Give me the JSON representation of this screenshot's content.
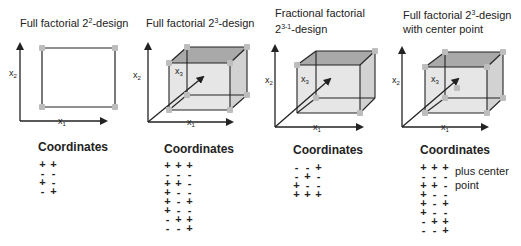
{
  "colors": {
    "line": "#222222",
    "vertex": "#bdbdbd",
    "face_front": "#e6e6e6",
    "face_top": "#a9a9a9",
    "face_side": "#d2d2d2"
  },
  "panels": [
    {
      "id": "full-2-2",
      "title_lines": [
        {
          "pre": "Full factorial  2",
          "sup": "2",
          "post": "-design"
        }
      ],
      "title_pos": [
        20,
        14
      ],
      "axis_labels": {
        "x1": "x",
        "x1_sub": "1",
        "x2": "x",
        "x2_sub": "2"
      },
      "coord_heading": "Coordinates",
      "coord_heading_pos": [
        38,
        140
      ],
      "coords_pos": [
        37,
        160
      ],
      "coordinates": [
        [
          "+",
          "+"
        ],
        [
          "-",
          "-"
        ],
        [
          "+",
          "-"
        ],
        [
          "-",
          "+"
        ]
      ],
      "note": []
    },
    {
      "id": "full-2-3",
      "title_lines": [
        {
          "pre": "Full factorial  2",
          "sup": "3",
          "post": "-design"
        }
      ],
      "title_pos": [
        146,
        14
      ],
      "axis_labels": {
        "x1": "x",
        "x1_sub": "1",
        "x2": "x",
        "x2_sub": "2",
        "x3": "x",
        "x3_sub": "3"
      },
      "coord_heading": "Coordinates",
      "coord_heading_pos": [
        164,
        142
      ],
      "coords_pos": [
        162,
        161
      ],
      "coordinates": [
        [
          "+",
          "+",
          "+"
        ],
        [
          "-",
          "-",
          "-"
        ],
        [
          "+",
          "+",
          "-"
        ],
        [
          "+",
          "-",
          "-"
        ],
        [
          "+",
          "-",
          "+"
        ],
        [
          "+",
          "-",
          "-"
        ],
        [
          "-",
          "+",
          "+"
        ],
        [
          "-",
          "-",
          "+"
        ]
      ],
      "note": []
    },
    {
      "id": "fractional-2-3-1",
      "title_lines": [
        {
          "pre": "Fractional factorial",
          "sup": "",
          "post": ""
        },
        {
          "pre": "2",
          "sup": "3-1",
          "post": "-design"
        }
      ],
      "title_pos": [
        275,
        6
      ],
      "axis_labels": {
        "x1": "x",
        "x1_sub": "1",
        "x2": "x",
        "x2_sub": "2",
        "x3": "x",
        "x3_sub": "3"
      },
      "coord_heading": "Coordinates",
      "coord_heading_pos": [
        293,
        143
      ],
      "coords_pos": [
        291,
        163
      ],
      "coordinates": [
        [
          "-",
          "-",
          "+"
        ],
        [
          "-",
          "+",
          "-"
        ],
        [
          "+",
          "-",
          "-"
        ],
        [
          "+",
          "+",
          "+"
        ]
      ],
      "note": []
    },
    {
      "id": "full-2-3-center",
      "title_lines": [
        {
          "pre": "Full factorial  2",
          "sup": "3",
          "post": "-design"
        },
        {
          "pre": "with center point",
          "sup": "",
          "post": ""
        }
      ],
      "title_pos": [
        403,
        6
      ],
      "axis_labels": {
        "x1": "x",
        "x1_sub": "1",
        "x2": "x",
        "x2_sub": "2",
        "x3": "x",
        "x3_sub": "3"
      },
      "coord_heading": "Coordinates",
      "coord_heading_pos": [
        420,
        143
      ],
      "coords_pos": [
        418,
        163
      ],
      "coordinates": [
        [
          "+",
          "+",
          "+"
        ],
        [
          "-",
          "-",
          "-"
        ],
        [
          "+",
          "+",
          "-"
        ],
        [
          "+",
          "-",
          "-"
        ],
        [
          "+",
          "-",
          "+"
        ],
        [
          "+",
          "-",
          "-"
        ],
        [
          "-",
          "+",
          "+"
        ],
        [
          "-",
          "-",
          "+"
        ]
      ],
      "note": [
        "plus center",
        "point"
      ],
      "note_pos": [
        455,
        164
      ]
    }
  ],
  "geometry": {
    "square": {
      "origin": [
        20,
        121
      ],
      "y_top": 38,
      "x_right": 112,
      "corners": [
        [
          42,
          48
        ],
        [
          115,
          48
        ],
        [
          115,
          107
        ],
        [
          42,
          107
        ]
      ],
      "x1_label": [
        58,
        124
      ],
      "x2_label": [
        9,
        76
      ]
    },
    "cubes": [
      {
        "origin": [
          148,
          122
        ],
        "y_top": 38,
        "x_right": 238,
        "front": [
          [
            169,
            63
          ],
          [
            230,
            63
          ],
          [
            230,
            110
          ],
          [
            169,
            110
          ]
        ],
        "back": [
          [
            187,
            47
          ],
          [
            247,
            47
          ],
          [
            247,
            95
          ],
          [
            187,
            95
          ]
        ],
        "x3_tip": [
          203,
          77
        ],
        "vertices": [
          [
            169,
            63
          ],
          [
            230,
            63
          ],
          [
            230,
            110
          ],
          [
            169,
            110
          ],
          [
            187,
            47
          ],
          [
            247,
            47
          ],
          [
            247,
            95
          ],
          [
            187,
            95
          ]
        ],
        "center": null,
        "x1_label": [
          187,
          125
        ],
        "x2_label": [
          133,
          78
        ],
        "x3_label": [
          175,
          74
        ]
      },
      {
        "origin": [
          275,
          127
        ],
        "y_top": 40,
        "x_right": 368,
        "front": [
          [
            297,
            65
          ],
          [
            360,
            65
          ],
          [
            360,
            113
          ],
          [
            297,
            113
          ]
        ],
        "back": [
          [
            316,
            51
          ],
          [
            375,
            51
          ],
          [
            375,
            98
          ],
          [
            316,
            98
          ]
        ],
        "x3_tip": [
          330,
          79
        ],
        "vertices": [
          [
            297,
            65
          ],
          [
            375,
            51
          ],
          [
            316,
            98
          ],
          [
            360,
            113
          ]
        ],
        "center": null,
        "x1_label": [
          313,
          130
        ],
        "x2_label": [
          265,
          83
        ],
        "x3_label": [
          301,
          82
        ]
      },
      {
        "origin": [
          402,
          127
        ],
        "y_top": 42,
        "x_right": 493,
        "front": [
          [
            425,
            67
          ],
          [
            487,
            67
          ],
          [
            487,
            113
          ],
          [
            425,
            113
          ]
        ],
        "back": [
          [
            445,
            52
          ],
          [
            503,
            52
          ],
          [
            503,
            98
          ],
          [
            445,
            98
          ]
        ],
        "x3_tip": [
          458,
          79
        ],
        "vertices": [
          [
            425,
            67
          ],
          [
            487,
            67
          ],
          [
            487,
            113
          ],
          [
            425,
            113
          ],
          [
            445,
            52
          ],
          [
            503,
            52
          ],
          [
            503,
            98
          ],
          [
            445,
            98
          ]
        ],
        "center": [
          457,
          88
        ],
        "x1_label": [
          441,
          130
        ],
        "x2_label": [
          392,
          83
        ],
        "x3_label": [
          431,
          82
        ]
      }
    ]
  }
}
